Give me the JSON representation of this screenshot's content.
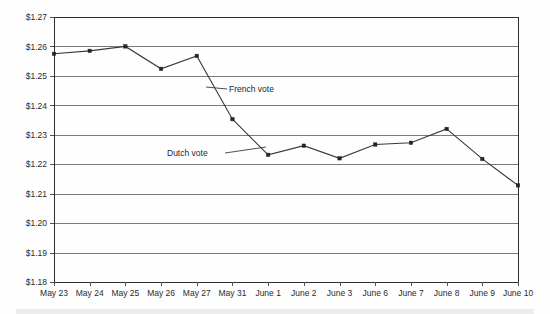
{
  "chart_data": {
    "type": "line",
    "title": "",
    "subtitle": "",
    "xlabel": "",
    "ylabel": "",
    "categories": [
      "May 23",
      "May 24",
      "May 25",
      "May 26",
      "May 27",
      "May 31",
      "June 1",
      "June 2",
      "June 3",
      "June 6",
      "June 7",
      "June 8",
      "June 9",
      "June 10"
    ],
    "series": [
      {
        "name": "Euro exchange rate",
        "values": [
          1.2575,
          1.2585,
          1.26,
          1.2524,
          1.2568,
          1.2353,
          1.2232,
          1.2263,
          1.222,
          1.2267,
          1.2273,
          1.232,
          1.2218,
          1.2128
        ]
      }
    ],
    "ylim": [
      1.18,
      1.27
    ],
    "ytick_values": [
      1.27,
      1.26,
      1.25,
      1.24,
      1.23,
      1.22,
      1.21,
      1.2,
      1.19,
      1.18
    ],
    "ytick_labels": [
      "$1.27",
      "$1.26",
      "$1.25",
      "$1.24",
      "$1.23",
      "$1.22",
      "$1.21",
      "$1.20",
      "$1.19",
      "$1.18"
    ],
    "grid": true,
    "legend": "none",
    "annotations": [
      {
        "id": "french-vote",
        "text": "French vote",
        "label_x": 229,
        "label_y": 92,
        "leader_from_x": 227,
        "leader_from_y": 89,
        "leader_to_x": 206,
        "leader_to_y": 87
      },
      {
        "id": "dutch-vote",
        "text": "Dutch vote",
        "label_x": 167,
        "label_y": 156,
        "leader_from_x": 225,
        "leader_from_y": 153,
        "leader_to_x": 266,
        "leader_to_y": 147
      }
    ],
    "colors": {
      "line": "#3a3a3a",
      "marker": "#242424",
      "grid": "#7a7a7a",
      "axis": "#2e2e2e",
      "background": "#fefefe",
      "text": "#2b2b2b"
    }
  }
}
